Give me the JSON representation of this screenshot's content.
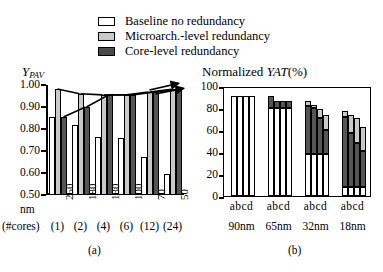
{
  "legend": {
    "items": [
      {
        "label": "Baseline no redundancy",
        "swatch": "white",
        "color": "#ffffff"
      },
      {
        "label": "Microarch.-level redundancy",
        "swatch": "light",
        "color": "#c9c9c9"
      },
      {
        "label": "Core-level redundancy",
        "swatch": "dark",
        "color": "#555555"
      }
    ]
  },
  "panel_a": {
    "caption": "(a)",
    "title_main": "Y",
    "title_sub": "PAV",
    "row_label_1": "nm",
    "row_label_2": "(#cores)",
    "chart_data": {
      "type": "bar",
      "title": "Y_PAV",
      "xlabel": "nm (#cores)",
      "ylabel": "Y_PAV",
      "ylim": [
        0.5,
        1.0
      ],
      "yticks": [
        "0.50",
        "0.60",
        "0.70",
        "0.80",
        "0.90",
        "1.00"
      ],
      "grid": false,
      "legend_position": "top",
      "categories": [
        "250",
        "180",
        "130",
        "100",
        "70",
        "50"
      ],
      "cores": [
        "(1)",
        "(2)",
        "(4)",
        "(6)",
        "(12)",
        "(24)"
      ],
      "series": [
        {
          "name": "Baseline no redundancy",
          "values": [
            0.855,
            0.82,
            0.765,
            0.757,
            0.675,
            0.595
          ]
        },
        {
          "name": "Microarch.-level redundancy",
          "values": [
            0.982,
            0.96,
            0.955,
            0.955,
            0.968,
            0.98
          ]
        },
        {
          "name": "Core-level redundancy",
          "values": [
            0.855,
            0.9,
            0.955,
            0.955,
            0.968,
            0.98
          ]
        }
      ],
      "annotations": [
        "arrow-to-microarch-top",
        "arrow-to-core-top"
      ]
    }
  },
  "panel_b": {
    "caption": "(b)",
    "title_prefix": "Normalized ",
    "title_italic": "YAT",
    "title_suffix": "(%)",
    "chart_data": {
      "type": "bar",
      "stacked": true,
      "title": "Normalized YAT(%)",
      "xlabel": "",
      "ylabel": "Normalized YAT(%)",
      "ylim": [
        0,
        100
      ],
      "yticks": [
        "0",
        "20",
        "40",
        "60",
        "80",
        "100"
      ],
      "grid": false,
      "groups": [
        "90nm",
        "65nm",
        "32nm",
        "18nm"
      ],
      "bar_labels": [
        "a",
        "b",
        "c",
        "d"
      ],
      "segments": [
        "Baseline no redundancy",
        "Core-level redundancy",
        "Microarch.-level redundancy"
      ],
      "data": [
        {
          "group": "90nm",
          "bars": [
            {
              "label": "a",
              "white": 91,
              "dark": 0,
              "light": 0,
              "total": 91
            },
            {
              "label": "b",
              "white": 91,
              "dark": 0,
              "light": 0,
              "total": 91
            },
            {
              "label": "c",
              "white": 91,
              "dark": 0,
              "light": 0,
              "total": 91
            },
            {
              "label": "d",
              "white": 91,
              "dark": 0,
              "light": 0,
              "total": 91
            }
          ]
        },
        {
          "group": "65nm",
          "bars": [
            {
              "label": "a",
              "white": 80,
              "dark": 11,
              "light": 0,
              "total": 91
            },
            {
              "label": "b",
              "white": 80,
              "dark": 6,
              "light": 0,
              "total": 86
            },
            {
              "label": "c",
              "white": 80,
              "dark": 6,
              "light": 0,
              "total": 86
            },
            {
              "label": "d",
              "white": 80,
              "dark": 6,
              "light": 0,
              "total": 86
            }
          ]
        },
        {
          "group": "32nm",
          "bars": [
            {
              "label": "a",
              "white": 38,
              "dark": 44,
              "light": 4,
              "total": 86
            },
            {
              "label": "b",
              "white": 38,
              "dark": 42,
              "light": 3,
              "total": 83
            },
            {
              "label": "c",
              "white": 38,
              "dark": 33,
              "light": 8,
              "total": 79
            },
            {
              "label": "d",
              "white": 38,
              "dark": 22,
              "light": 14,
              "total": 74
            }
          ]
        },
        {
          "group": "18nm",
          "bars": [
            {
              "label": "a",
              "white": 8,
              "dark": 64,
              "light": 5,
              "total": 77
            },
            {
              "label": "b",
              "white": 8,
              "dark": 49,
              "light": 17,
              "total": 74
            },
            {
              "label": "c",
              "white": 8,
              "dark": 40,
              "light": 23,
              "total": 71
            },
            {
              "label": "d",
              "white": 8,
              "dark": 33,
              "light": 22,
              "total": 63
            }
          ]
        }
      ]
    }
  }
}
